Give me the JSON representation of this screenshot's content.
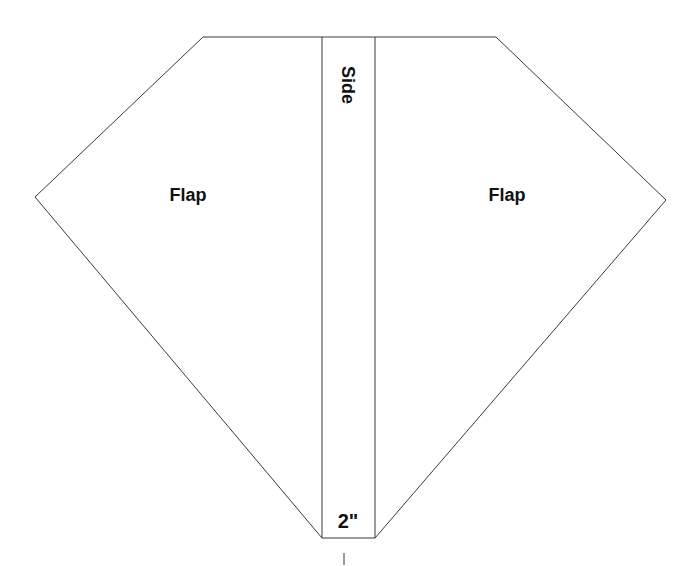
{
  "diagram": {
    "type": "sewing-pattern-template",
    "labels": {
      "left_flap": "Flap",
      "right_flap": "Flap",
      "side": "Side",
      "width_measure": "2\"",
      "tick_mark": "I"
    },
    "colors": {
      "background": "#ffffff",
      "outline": "#3a3a3a",
      "text": "#111111"
    },
    "shape": {
      "outline_points": [
        [
          203,
          37
        ],
        [
          496,
          37
        ],
        [
          666,
          200
        ],
        [
          375,
          538
        ],
        [
          322,
          538
        ],
        [
          35,
          197
        ]
      ],
      "center_strip": {
        "x_left": 322,
        "x_right": 375,
        "y_top": 37,
        "y_bottom": 538
      }
    }
  }
}
